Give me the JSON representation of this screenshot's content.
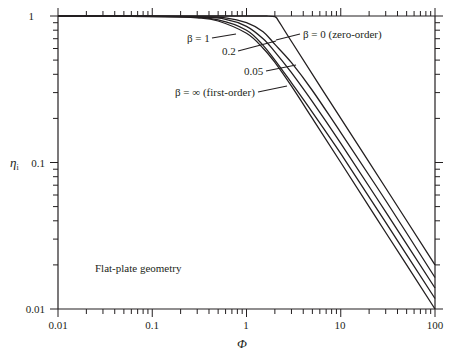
{
  "chart_data": {
    "type": "line",
    "title": "",
    "xlabel": "Φ",
    "ylabel": "ηi",
    "xscale": "log",
    "yscale": "log",
    "xlim": [
      0.01,
      100
    ],
    "ylim": [
      0.01,
      1
    ],
    "grid": false,
    "x_tick_labels": [
      "0.01",
      "0.1",
      "1",
      "10",
      "100"
    ],
    "y_tick_labels": [
      "0.01",
      "0.1",
      "1"
    ],
    "annotation": "Flat-plate geometry",
    "series": [
      {
        "name": "β = 0 (zero-order)",
        "label": "β = 0 (zero-order)",
        "points": [
          [
            0.01,
            1.0
          ],
          [
            1.0,
            1.0
          ],
          [
            1.6,
            1.0
          ],
          [
            2.0,
            0.99
          ],
          [
            2.2,
            0.92
          ],
          [
            3,
            0.67
          ],
          [
            10,
            0.2
          ],
          [
            30,
            0.067
          ],
          [
            100,
            0.02
          ]
        ]
      },
      {
        "name": "β = 1",
        "label": "β = 1",
        "points": [
          [
            0.01,
            1.0
          ],
          [
            0.3,
            0.99
          ],
          [
            0.6,
            0.97
          ],
          [
            1.0,
            0.9
          ],
          [
            1.5,
            0.78
          ],
          [
            2.0,
            0.64
          ],
          [
            3,
            0.48
          ],
          [
            5,
            0.31
          ],
          [
            10,
            0.16
          ],
          [
            30,
            0.055
          ],
          [
            100,
            0.0164
          ]
        ]
      },
      {
        "name": "β = 0.2",
        "label": "0.2",
        "points": [
          [
            0.01,
            1.0
          ],
          [
            0.3,
            0.985
          ],
          [
            0.6,
            0.95
          ],
          [
            1.0,
            0.85
          ],
          [
            1.5,
            0.7
          ],
          [
            2.0,
            0.57
          ],
          [
            3,
            0.41
          ],
          [
            5,
            0.26
          ],
          [
            10,
            0.135
          ],
          [
            30,
            0.046
          ],
          [
            100,
            0.0139
          ]
        ]
      },
      {
        "name": "β = 0.05",
        "label": "0.05",
        "points": [
          [
            0.01,
            1.0
          ],
          [
            0.2,
            0.99
          ],
          [
            0.5,
            0.94
          ],
          [
            1.0,
            0.8
          ],
          [
            1.5,
            0.63
          ],
          [
            2.0,
            0.5
          ],
          [
            3,
            0.35
          ],
          [
            5,
            0.22
          ],
          [
            10,
            0.115
          ],
          [
            30,
            0.039
          ],
          [
            100,
            0.0118
          ]
        ]
      },
      {
        "name": "β = ∞ (first-order)",
        "label": "β = ∞ (first-order)",
        "points": [
          [
            0.01,
            1.0
          ],
          [
            0.1,
            0.997
          ],
          [
            0.3,
            0.971
          ],
          [
            0.5,
            0.924
          ],
          [
            1.0,
            0.762
          ],
          [
            1.5,
            0.603
          ],
          [
            2.0,
            0.482
          ],
          [
            3,
            0.332
          ],
          [
            5,
            0.2
          ],
          [
            10,
            0.1
          ],
          [
            30,
            0.0333
          ],
          [
            100,
            0.01
          ]
        ]
      }
    ]
  },
  "labels": {
    "x_axis": "Φ",
    "y_axis_main": "η",
    "y_axis_sub": "i",
    "x_ticks": [
      "0.01",
      "0.1",
      "1",
      "10",
      "100"
    ],
    "y_ticks": [
      "0.01",
      "0.1",
      "1"
    ],
    "annotation": "Flat-plate geometry",
    "beta_zero": "β = 0 (zero-order)",
    "beta_one": "β = 1",
    "beta_02": "0.2",
    "beta_005": "0.05",
    "beta_inf": "β = ∞ (first-order)"
  }
}
